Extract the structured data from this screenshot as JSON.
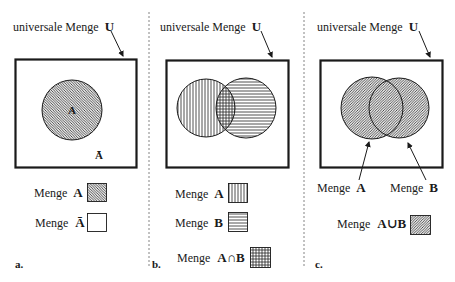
{
  "panels": {
    "a": {
      "universe_label": "universale Menge",
      "universe_symbol": "U",
      "circle_label": "A",
      "complement_label": "Ā",
      "legend": [
        {
          "label": "Menge",
          "symbol": "A",
          "pattern": "diagonal-hatch"
        },
        {
          "label": "Menge",
          "symbol": "Ā",
          "pattern": "empty"
        }
      ],
      "panel_label": "a."
    },
    "b": {
      "universe_label": "universale Menge",
      "universe_symbol": "U",
      "legend": [
        {
          "label": "Menge",
          "symbol": "A",
          "pattern": "vertical-lines"
        },
        {
          "label": "Menge",
          "symbol": "B",
          "pattern": "horizontal-lines"
        },
        {
          "label": "Menge",
          "symbol": "A∩B",
          "pattern": "grid"
        }
      ],
      "panel_label": "b."
    },
    "c": {
      "universe_label": "universale Menge",
      "universe_symbol": "U",
      "pointer_labels": [
        {
          "label": "Menge",
          "symbol": "A"
        },
        {
          "label": "Menge",
          "symbol": "B"
        }
      ],
      "legend": [
        {
          "label": "Menge",
          "symbol": "A∪B",
          "pattern": "diagonal-hatch"
        }
      ],
      "panel_label": "c."
    }
  },
  "colors": {
    "ink": "#1a1a1a",
    "divider": "#777777",
    "background": "#ffffff"
  }
}
